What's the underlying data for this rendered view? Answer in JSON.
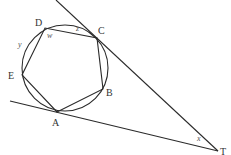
{
  "diagram": {
    "type": "geometry",
    "circle": {
      "cx": 65,
      "cy": 68,
      "r": 43
    },
    "points": {
      "A": {
        "label": "A",
        "x": 57,
        "y": 112
      },
      "B": {
        "label": "B",
        "x": 103,
        "y": 89
      },
      "C": {
        "label": "C",
        "x": 97,
        "y": 38
      },
      "D": {
        "label": "D",
        "x": 45,
        "y": 28
      },
      "E": {
        "label": "E",
        "x": 22,
        "y": 75
      },
      "T": {
        "label": "T",
        "x": 218,
        "y": 151
      }
    },
    "angle_labels": {
      "w": "w",
      "x": "x",
      "y": "y",
      "z": "z"
    },
    "colors": {
      "stroke": "#2a2a2a",
      "text": "#333333",
      "background": "#ffffff"
    }
  }
}
